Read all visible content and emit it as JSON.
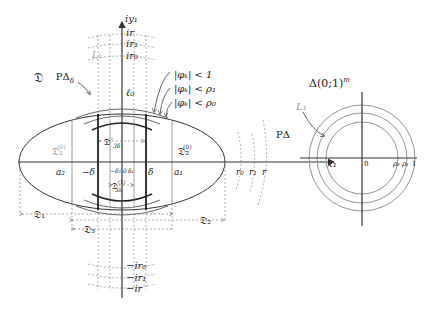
{
  "left_figure": {
    "domain_label": "𝔇",
    "y_axis_label": "iy₁",
    "x_axis_label": "x₁",
    "top_marks": [
      "ir",
      "ir₁",
      "ir₀"
    ],
    "bottom_marks": [
      "−ir₀",
      "−ir₁",
      "−ir"
    ],
    "x_marks": {
      "a2": "a₂",
      "minus_delta": "−δ",
      "minus_delta1": "−δ₁",
      "zero": "0",
      "delta1": "δ₁",
      "delta": "δ",
      "a1": "a₁",
      "r0": "r₀",
      "r1": "r₁",
      "r": "r"
    },
    "l0_label": "ℓ₀",
    "p_delta_delta": "PΔ",
    "p_delta_delta_sub": "δ",
    "p_delta": "PΔ",
    "l1_faint": "L₁",
    "region_labels": {
      "d1_0": "𝔇₁",
      "d1_0_sup": "(0)",
      "d2_0": "𝔇₂",
      "d2_0_sup": "(0)",
      "d3delta_prime": "𝔇′",
      "d3delta_sub": "3δ",
      "d3delta1": "𝔇",
      "d3delta1_sup": "(1)",
      "d3delta1_sub": "3δ₁",
      "d1": "𝔇₁",
      "d2": "𝔇₂",
      "d3": "𝔇₃"
    },
    "inequalities": [
      "|φₖ| < 1",
      "|φₖ| < ρ₁",
      "|φₖ| < ρ₀"
    ]
  },
  "right_figure": {
    "title": "Δ(0;1)",
    "title_sup": "m",
    "l1_label": "L₁",
    "origin": "0",
    "x_marks": [
      "ρ₀",
      "ρ₁",
      "1"
    ]
  }
}
